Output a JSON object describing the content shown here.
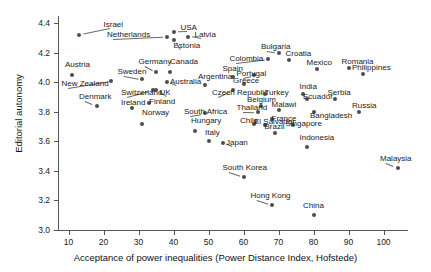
{
  "chart_data": {
    "type": "scatter",
    "title": "",
    "xlabel": "Acceptance of power inequalities (Power Distance Index, Hofstede)",
    "ylabel": "Editorial autonomy",
    "xlim": [
      7,
      107
    ],
    "ylim": [
      3.0,
      4.45
    ],
    "xticks": [
      10,
      20,
      30,
      40,
      50,
      60,
      70,
      80,
      90,
      100
    ],
    "yticks": [
      3.0,
      3.2,
      3.4,
      3.6,
      3.8,
      4.0,
      4.2,
      4.4
    ],
    "grid": false,
    "legend": "none",
    "point_color": "#4d4d4d",
    "points": [
      {
        "label": "Israel",
        "x": 13,
        "y": 4.32,
        "lx": 20,
        "ly": 4.39,
        "anchor": "start"
      },
      {
        "label": "Austria",
        "x": 11,
        "y": 4.05,
        "lx": 9,
        "ly": 4.12,
        "anchor": "start"
      },
      {
        "label": "New Zealand",
        "x": 22,
        "y": 4.01,
        "lx": 8,
        "ly": 3.99,
        "anchor": "start"
      },
      {
        "label": "Denmark",
        "x": 18,
        "y": 3.84,
        "lx": 13,
        "ly": 3.9,
        "anchor": "start"
      },
      {
        "label": "Netherlands",
        "x": 38,
        "y": 4.31,
        "lx": 21,
        "ly": 4.32,
        "anchor": "start"
      },
      {
        "label": "USA",
        "x": 40,
        "y": 4.34,
        "lx": 42,
        "ly": 4.37,
        "anchor": "start"
      },
      {
        "label": "Latvia",
        "x": 44,
        "y": 4.31,
        "lx": 46,
        "ly": 4.32,
        "anchor": "start"
      },
      {
        "label": "Estonia",
        "x": 40,
        "y": 4.29,
        "lx": 40,
        "ly": 4.25,
        "anchor": "start"
      },
      {
        "label": "Germany",
        "x": 35,
        "y": 4.07,
        "lx": 30,
        "ly": 4.14,
        "anchor": "start"
      },
      {
        "label": "Canada",
        "x": 39,
        "y": 4.07,
        "lx": 39,
        "ly": 4.14,
        "anchor": "start"
      },
      {
        "label": "Sweden",
        "x": 31,
        "y": 4.02,
        "lx": 24,
        "ly": 4.07,
        "anchor": "start"
      },
      {
        "label": "Australia",
        "x": 38,
        "y": 4.0,
        "lx": 39,
        "ly": 4.0,
        "anchor": "start"
      },
      {
        "label": "Spain",
        "x": 57,
        "y": 4.04,
        "lx": 54,
        "ly": 4.09,
        "anchor": "start"
      },
      {
        "label": "Argentina",
        "x": 49,
        "y": 3.98,
        "lx": 47,
        "ly": 4.04,
        "anchor": "start"
      },
      {
        "label": "Switzerland",
        "x": 34,
        "y": 3.95,
        "lx": 25,
        "ly": 3.93,
        "anchor": "start"
      },
      {
        "label": "UK",
        "x": 35,
        "y": 3.95,
        "lx": 36,
        "ly": 3.93,
        "anchor": "start"
      },
      {
        "label": "Czech Republic",
        "x": 57,
        "y": 3.95,
        "lx": 51,
        "ly": 3.93,
        "anchor": "start"
      },
      {
        "label": "Greece",
        "x": 60,
        "y": 3.99,
        "lx": 57,
        "ly": 4.01,
        "anchor": "start"
      },
      {
        "label": "Portugal",
        "x": 63,
        "y": 4.05,
        "lx": 58,
        "ly": 4.06,
        "anchor": "start"
      },
      {
        "label": "Colombia",
        "x": 67,
        "y": 4.16,
        "lx": 56,
        "ly": 4.16,
        "anchor": "start"
      },
      {
        "label": "Bulgaria",
        "x": 70,
        "y": 4.2,
        "lx": 65,
        "ly": 4.24,
        "anchor": "start"
      },
      {
        "label": "Croatia",
        "x": 73,
        "y": 4.15,
        "lx": 72,
        "ly": 4.19,
        "anchor": "start"
      },
      {
        "label": "Mexico",
        "x": 81,
        "y": 4.09,
        "lx": 78,
        "ly": 4.13,
        "anchor": "start"
      },
      {
        "label": "Romania",
        "x": 90,
        "y": 4.1,
        "lx": 88,
        "ly": 4.14,
        "anchor": "start"
      },
      {
        "label": "Philippines",
        "x": 94,
        "y": 4.06,
        "lx": 91,
        "ly": 4.1,
        "anchor": "start"
      },
      {
        "label": "Ireland",
        "x": 28,
        "y": 3.83,
        "lx": 25,
        "ly": 3.86,
        "anchor": "start"
      },
      {
        "label": "Finland",
        "x": 33,
        "y": 3.86,
        "lx": 33,
        "ly": 3.87,
        "anchor": "start"
      },
      {
        "label": "Norway",
        "x": 31,
        "y": 3.72,
        "lx": 31,
        "ly": 3.79,
        "anchor": "start"
      },
      {
        "label": "South Africa",
        "x": 49,
        "y": 3.79,
        "lx": 43,
        "ly": 3.8,
        "anchor": "start"
      },
      {
        "label": "Hungary",
        "x": 46,
        "y": 3.67,
        "lx": 45,
        "ly": 3.74,
        "anchor": "start"
      },
      {
        "label": "Italy",
        "x": 50,
        "y": 3.6,
        "lx": 49,
        "ly": 3.66,
        "anchor": "start"
      },
      {
        "label": "Japan",
        "x": 54,
        "y": 3.59,
        "lx": 55,
        "ly": 3.59,
        "anchor": "start"
      },
      {
        "label": "Turkey",
        "x": 66,
        "y": 3.92,
        "lx": 66,
        "ly": 3.93,
        "anchor": "start"
      },
      {
        "label": "Belgium",
        "x": 65,
        "y": 3.84,
        "lx": 61,
        "ly": 3.88,
        "anchor": "start"
      },
      {
        "label": "Thailand",
        "x": 64,
        "y": 3.8,
        "lx": 58,
        "ly": 3.83,
        "anchor": "start"
      },
      {
        "label": "Malawi",
        "x": 70,
        "y": 3.81,
        "lx": 68,
        "ly": 3.85,
        "anchor": "start"
      },
      {
        "label": "Chile",
        "x": 63,
        "y": 3.72,
        "lx": 59,
        "ly": 3.74,
        "anchor": "start"
      },
      {
        "label": "El Salvador",
        "x": 66,
        "y": 3.71,
        "lx": 63,
        "ly": 3.73,
        "anchor": "start"
      },
      {
        "label": "France",
        "x": 68,
        "y": 3.75,
        "lx": 68,
        "ly": 3.75,
        "anchor": "start"
      },
      {
        "label": "Singapore",
        "x": 74,
        "y": 3.71,
        "lx": 72,
        "ly": 3.72,
        "anchor": "start"
      },
      {
        "label": "Brazil",
        "x": 69,
        "y": 3.66,
        "lx": 66,
        "ly": 3.7,
        "anchor": "start"
      },
      {
        "label": "India",
        "x": 77,
        "y": 3.92,
        "lx": 76,
        "ly": 3.97,
        "anchor": "start"
      },
      {
        "label": "Ecuador",
        "x": 78,
        "y": 3.89,
        "lx": 77,
        "ly": 3.9,
        "anchor": "start"
      },
      {
        "label": "Serbia",
        "x": 86,
        "y": 3.89,
        "lx": 84,
        "ly": 3.93,
        "anchor": "start"
      },
      {
        "label": "Bangladesh",
        "x": 80,
        "y": 3.8,
        "lx": 79,
        "ly": 3.77,
        "anchor": "start"
      },
      {
        "label": "Russia",
        "x": 93,
        "y": 3.8,
        "lx": 91,
        "ly": 3.84,
        "anchor": "start"
      },
      {
        "label": "Indonesia",
        "x": 78,
        "y": 3.56,
        "lx": 76,
        "ly": 3.62,
        "anchor": "start"
      },
      {
        "label": "Malaysia",
        "x": 104,
        "y": 3.42,
        "lx": 99,
        "ly": 3.48,
        "anchor": "start"
      },
      {
        "label": "South Korea",
        "x": 60,
        "y": 3.36,
        "lx": 54,
        "ly": 3.42,
        "anchor": "start"
      },
      {
        "label": "Hong Kong",
        "x": 68,
        "y": 3.17,
        "lx": 62,
        "ly": 3.23,
        "anchor": "start"
      },
      {
        "label": "China",
        "x": 80,
        "y": 3.1,
        "lx": 77,
        "ly": 3.16,
        "anchor": "start"
      }
    ]
  }
}
